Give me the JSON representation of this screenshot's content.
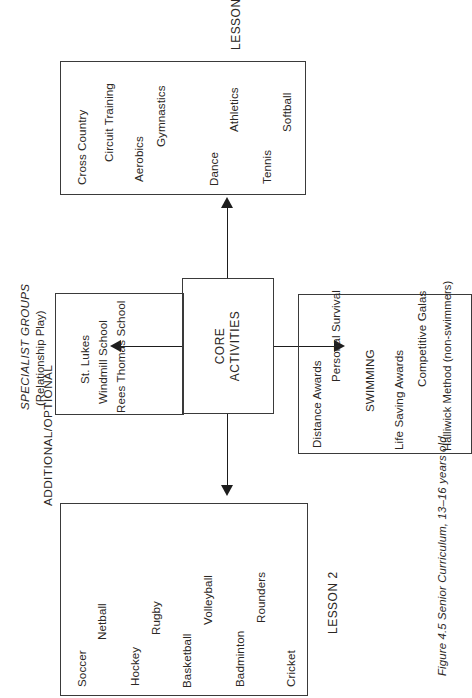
{
  "figure": {
    "caption": "Figure 4.5  Senior Curriculum, 13–16 years old"
  },
  "headers": {
    "additional_optional": "ADDITIONAL/OPTIONAL"
  },
  "core": {
    "line1": "CORE",
    "line2": "ACTIVITIES"
  },
  "specialist": {
    "title": "SPECIALIST GROUPS",
    "subtitle": "(Relationship Play)",
    "items": [
      "St. Lukes",
      "Windmill School",
      "Rees Thomas School"
    ]
  },
  "lesson1": {
    "tag": "LESSON 1",
    "items": [
      "Distance Awards",
      "Personal Survival",
      "SWIMMING",
      "Life Saving Awards",
      "Competitive Galas",
      "Halliwick Method (non-swimmers)"
    ]
  },
  "lesson2": {
    "tag": "LESSON 2",
    "items": [
      "Soccer",
      "Netball",
      "Hockey",
      "Rugby",
      "Basketball",
      "Volleyball",
      "Badminton",
      "Rounders",
      "Cricket"
    ]
  },
  "lesson3": {
    "tag": "LESSON 3",
    "items": [
      "Cross Country",
      "Circuit Training",
      "Aerobics",
      "Gymnastics",
      "Dance",
      "Athletics",
      "Tennis",
      "Softball"
    ]
  },
  "colors": {
    "ink": "#2b2724",
    "stroke": "#3a3a3a",
    "paper": "#ffffff"
  }
}
